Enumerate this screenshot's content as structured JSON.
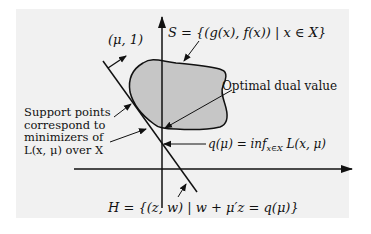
{
  "figure": {
    "panel_color": "#f1f1f1",
    "set_fill_color": "#c6c6c6",
    "line_color": "#111111"
  },
  "labels": {
    "mu_vector": "(μ, 1)",
    "set_S": "S = {(g(x), f(x)) | x ∈ X}",
    "optimal_dual": "Optimal dual value",
    "support_points": "Support points\ncorrespond to\nminimizers of\nL(x, μ) over X",
    "q_mu": "q(μ) = inf",
    "q_mu_sub": "x∈X",
    "q_mu_tail": " L(x, μ)",
    "hyperplane_H": "H = {(z, w) | w + μ′z = q(μ)}"
  }
}
